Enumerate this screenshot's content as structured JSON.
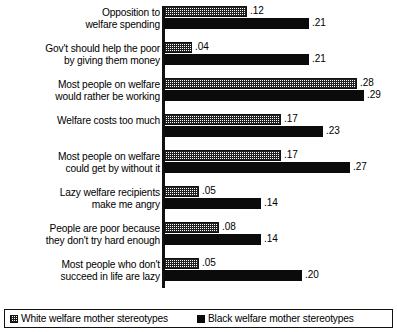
{
  "chart_data": {
    "type": "bar",
    "orientation": "horizontal",
    "title": "",
    "xlabel": "",
    "ylabel": "",
    "grid": false,
    "xlim": [
      0,
      0.29
    ],
    "legend_position": "bottom",
    "categories": [
      "Opposition to\nwelfare spending",
      "Gov't should help the poor\nby giving them money",
      "Most people on welfare\nwould rather be working",
      "Welfare costs too much",
      "Most people on welfare\ncould get by without it",
      "Lazy welfare recipients\nmake me angry",
      "People are poor because\nthey don't try hard enough",
      "Most people who don't\nsucceed in life are lazy"
    ],
    "series": [
      {
        "name": "White welfare mother stereotypes",
        "fill": "checkered",
        "color": "#ffffff",
        "values": [
          0.12,
          0.04,
          0.28,
          0.17,
          0.17,
          0.05,
          0.08,
          0.05
        ],
        "labels": [
          ".12",
          ".04",
          ".28",
          ".17",
          ".17",
          ".05",
          ".08",
          ".05"
        ]
      },
      {
        "name": "Black welfare mother stereotypes",
        "fill": "solid",
        "color": "#0b0b0b",
        "values": [
          0.21,
          0.21,
          0.29,
          0.23,
          0.27,
          0.14,
          0.14,
          0.2
        ],
        "labels": [
          ".21",
          ".21",
          ".29",
          ".23",
          ".27",
          ".14",
          ".14",
          ".20"
        ]
      }
    ]
  },
  "legend": {
    "items": [
      {
        "label": "White welfare mother stereotypes"
      },
      {
        "label": "Black welfare mother stereotypes"
      }
    ]
  }
}
